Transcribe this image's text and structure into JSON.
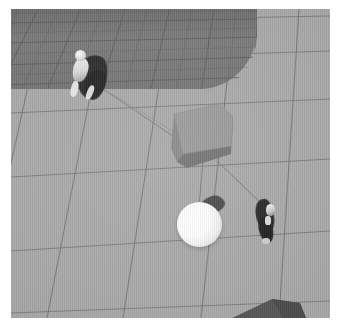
{
  "scene": {
    "title": "Top-down 3D arena render",
    "view": "overhead perspective",
    "palette": {
      "frame": "#ffffff",
      "floor": "#a9a9a9",
      "platform": "#7b7b7b",
      "grid_line": "#6d6d6d",
      "cube_top": "#9a9a9a",
      "cube_side": "#7e7e7e",
      "sphere": "#ffffff",
      "figure_dark": "#2b2b2b",
      "figure_light": "#e8e8e8",
      "tether": "#777777"
    },
    "frame": {
      "viewport_x": 11,
      "viewport_y": 9,
      "viewport_width": 319,
      "viewport_height": 309
    }
  },
  "floor": {
    "name": "tiled ground plane",
    "tile_color": "#a9a9a9",
    "grid_enabled": true,
    "grid_line_color": "#6d6d6d",
    "grid_rows": 6,
    "grid_cols": 6
  },
  "platform": {
    "name": "raised shadowed platform",
    "label": "upper-left platform",
    "color": "#7b7b7b",
    "corner": "rounded bottom-right"
  },
  "objects": [
    {
      "id": "cube",
      "name": "grey cube",
      "shape": "box",
      "x": 160,
      "y": 93,
      "width": 62,
      "height": 66,
      "color": "#8f8f8f"
    },
    {
      "id": "sphere",
      "name": "white sphere",
      "shape": "sphere",
      "x": 166,
      "y": 193,
      "diameter": 45,
      "color": "#ffffff"
    },
    {
      "id": "wedge",
      "name": "dark wedge ramp",
      "shape": "wedge",
      "x": 215,
      "y": 288,
      "width": 82,
      "height": 26,
      "color": "#565656"
    }
  ],
  "characters": [
    {
      "id": "hero",
      "name": "caped character",
      "x": 54,
      "y": 36,
      "facing": "down-right",
      "body_color": "#2e2e2e",
      "accent_color": "#eeeeee"
    },
    {
      "id": "npc",
      "name": "dark character",
      "x": 242,
      "y": 186,
      "facing": "left",
      "body_color": "#2b2b2b",
      "accent_color": "#e0e0e0"
    }
  ],
  "tethers": [
    {
      "id": "tether-hero-cube",
      "name": "tether from character to cube",
      "from": "hero",
      "to": "cube"
    },
    {
      "id": "tether-cube-sphere",
      "name": "tether from cube to sphere",
      "from": "cube",
      "to": "sphere"
    },
    {
      "id": "tether-cube-npc",
      "name": "tether from cube toward character",
      "from": "cube",
      "to": "npc"
    }
  ]
}
